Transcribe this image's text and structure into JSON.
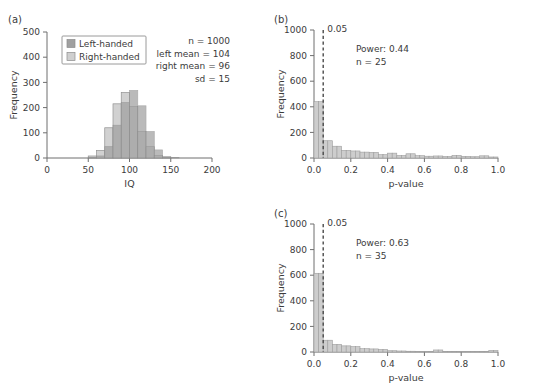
{
  "figure": {
    "panels": [
      {
        "tag": "(a)",
        "xlabel": "IQ",
        "ylabel": "Frequency",
        "annotations": [
          "n = 1000",
          "left mean = 104",
          "right mean = 96",
          "sd = 15"
        ],
        "legend": [
          {
            "label": "Left-handed",
            "color": "#a0a0a0"
          },
          {
            "label": "Right-handed",
            "color": "#cfcfcf"
          }
        ]
      },
      {
        "tag": "(b)",
        "xlabel": "p-value",
        "ylabel": "Frequency",
        "annotations": [
          "Power: 0.44",
          "n = 25"
        ],
        "threshold_label": "0.05"
      },
      {
        "tag": "(c)",
        "xlabel": "p-value",
        "ylabel": "Frequency",
        "annotations": [
          "Power: 0.63",
          "n = 35"
        ],
        "threshold_label": "0.05"
      }
    ]
  },
  "chart_data": [
    {
      "type": "bar",
      "panel": "(a)",
      "title": "",
      "xlabel": "IQ",
      "ylabel": "Frequency",
      "xlim": [
        0,
        200
      ],
      "ylim": [
        0,
        500
      ],
      "xticks": [
        0,
        50,
        100,
        150,
        200
      ],
      "yticks": [
        0,
        100,
        200,
        300,
        400,
        500
      ],
      "grid": false,
      "legend_position": "upper-left",
      "bin_width": 10,
      "bin_starts": [
        50,
        60,
        70,
        80,
        90,
        100,
        110,
        120,
        130,
        140,
        150
      ],
      "series": [
        {
          "name": "Left-handed",
          "color": "#a0a0a0",
          "values": [
            2,
            8,
            45,
            130,
            220,
            268,
            207,
            105,
            32,
            6,
            2
          ]
        },
        {
          "name": "Right-handed",
          "color": "#cfcfcf",
          "values": [
            8,
            30,
            120,
            215,
            260,
            205,
            105,
            45,
            10,
            2,
            0
          ]
        }
      ],
      "annotations": [
        "n = 1000",
        "left mean = 104",
        "right mean = 96",
        "sd = 15"
      ]
    },
    {
      "type": "bar",
      "panel": "(b)",
      "title": "",
      "xlabel": "p-value",
      "ylabel": "Frequency",
      "xlim": [
        0.0,
        1.0
      ],
      "ylim": [
        0,
        1000
      ],
      "xticks": [
        0.0,
        0.2,
        0.4,
        0.6,
        0.8,
        1.0
      ],
      "yticks": [
        0,
        200,
        400,
        600,
        800,
        1000
      ],
      "grid": false,
      "bin_width": 0.025,
      "bin_starts": [
        0.0,
        0.025,
        0.05,
        0.075,
        0.1,
        0.125,
        0.15,
        0.175,
        0.2,
        0.225,
        0.25,
        0.275,
        0.3,
        0.325,
        0.35,
        0.375,
        0.4,
        0.425,
        0.45,
        0.475,
        0.5,
        0.525,
        0.55,
        0.575,
        0.6,
        0.625,
        0.65,
        0.675,
        0.7,
        0.725,
        0.75,
        0.775,
        0.8,
        0.825,
        0.85,
        0.875,
        0.9,
        0.925,
        0.95,
        0.975
      ],
      "values": [
        440,
        440,
        135,
        135,
        92,
        92,
        60,
        60,
        55,
        55,
        46,
        46,
        44,
        44,
        26,
        26,
        38,
        38,
        20,
        20,
        33,
        33,
        18,
        18,
        14,
        14,
        16,
        16,
        12,
        12,
        20,
        20,
        13,
        13,
        10,
        10,
        17,
        17,
        8,
        8
      ],
      "color": "#cdcdcd",
      "threshold": {
        "value": 0.05,
        "label": "0.05",
        "style": "dashed"
      },
      "annotations": [
        "Power: 0.44",
        "n = 25"
      ]
    },
    {
      "type": "bar",
      "panel": "(c)",
      "title": "",
      "xlabel": "p-value",
      "ylabel": "Frequency",
      "xlim": [
        0.0,
        1.0
      ],
      "ylim": [
        0,
        1000
      ],
      "xticks": [
        0.0,
        0.2,
        0.4,
        0.6,
        0.8,
        1.0
      ],
      "yticks": [
        0,
        200,
        400,
        600,
        800,
        1000
      ],
      "grid": false,
      "bin_width": 0.025,
      "bin_starts": [
        0.0,
        0.025,
        0.05,
        0.075,
        0.1,
        0.125,
        0.15,
        0.175,
        0.2,
        0.225,
        0.25,
        0.275,
        0.3,
        0.325,
        0.35,
        0.375,
        0.4,
        0.425,
        0.45,
        0.475,
        0.5,
        0.525,
        0.55,
        0.575,
        0.6,
        0.625,
        0.65,
        0.675,
        0.7,
        0.725,
        0.75,
        0.775,
        0.8,
        0.825,
        0.85,
        0.875,
        0.9,
        0.925,
        0.95,
        0.975
      ],
      "values": [
        615,
        615,
        92,
        92,
        60,
        60,
        48,
        48,
        42,
        42,
        26,
        26,
        24,
        24,
        20,
        20,
        10,
        10,
        8,
        8,
        6,
        6,
        5,
        5,
        5,
        5,
        16,
        16,
        5,
        5,
        4,
        4,
        4,
        4,
        3,
        3,
        3,
        3,
        12,
        12
      ],
      "color": "#cdcdcd",
      "threshold": {
        "value": 0.05,
        "label": "0.05",
        "style": "dashed"
      },
      "annotations": [
        "Power: 0.63",
        "n = 35"
      ]
    }
  ]
}
